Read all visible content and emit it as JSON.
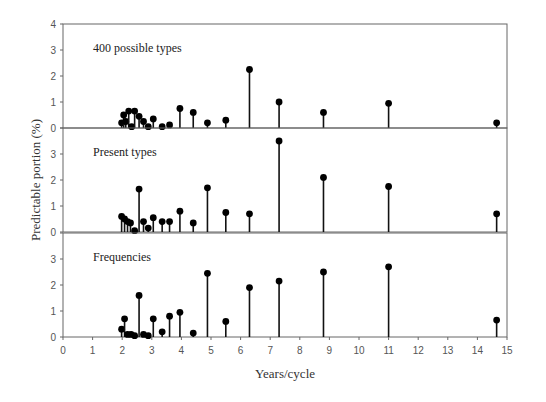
{
  "chart_data": {
    "type": "stem",
    "xlabel": "Years/cycle",
    "ylabel": "Predictable portion (%)",
    "xlim": [
      0,
      15
    ],
    "xticks": [
      0,
      1,
      2,
      3,
      4,
      5,
      6,
      7,
      8,
      9,
      10,
      11,
      12,
      13,
      14,
      15
    ],
    "ylim": [
      0,
      4
    ],
    "yticks": [
      0,
      1,
      2,
      3,
      4
    ],
    "grid": false,
    "panels": [
      {
        "title": "400 possible types",
        "x": [
          1.98,
          2.05,
          2.12,
          2.22,
          2.32,
          2.42,
          2.57,
          2.72,
          2.88,
          3.05,
          3.35,
          3.6,
          3.95,
          4.4,
          4.88,
          5.5,
          6.3,
          7.3,
          8.8,
          11.0,
          14.65
        ],
        "y": [
          0.2,
          0.5,
          0.25,
          0.65,
          0.05,
          0.65,
          0.45,
          0.25,
          0.05,
          0.35,
          0.05,
          0.12,
          0.75,
          0.6,
          0.2,
          0.3,
          2.25,
          1.0,
          0.6,
          0.95,
          0.2
        ]
      },
      {
        "title": "Present types",
        "x": [
          1.98,
          2.08,
          2.18,
          2.28,
          2.42,
          2.57,
          2.72,
          2.88,
          3.05,
          3.35,
          3.6,
          3.95,
          4.4,
          4.88,
          5.5,
          6.3,
          7.3,
          8.8,
          11.0,
          14.65
        ],
        "y": [
          0.6,
          0.5,
          0.4,
          0.35,
          0.05,
          1.65,
          0.4,
          0.15,
          0.55,
          0.4,
          0.4,
          0.8,
          0.35,
          1.7,
          0.75,
          0.7,
          3.5,
          2.1,
          1.75,
          0.7
        ]
      },
      {
        "title": "Frequencies",
        "x": [
          1.98,
          2.08,
          2.18,
          2.3,
          2.42,
          2.57,
          2.72,
          2.88,
          3.05,
          3.35,
          3.6,
          3.95,
          4.4,
          4.88,
          5.5,
          6.3,
          7.3,
          8.8,
          11.0,
          14.65
        ],
        "y": [
          0.3,
          0.7,
          0.1,
          0.1,
          0.05,
          1.6,
          0.1,
          0.05,
          0.7,
          0.2,
          0.8,
          0.95,
          0.15,
          2.45,
          0.6,
          1.9,
          2.15,
          2.5,
          2.7,
          0.65
        ]
      }
    ]
  },
  "labels": {
    "xlabel": "Years/cycle",
    "ylabel": "Predictable portion (%)",
    "panel_titles": [
      "400 possible types",
      "Present types",
      "Frequencies"
    ]
  }
}
